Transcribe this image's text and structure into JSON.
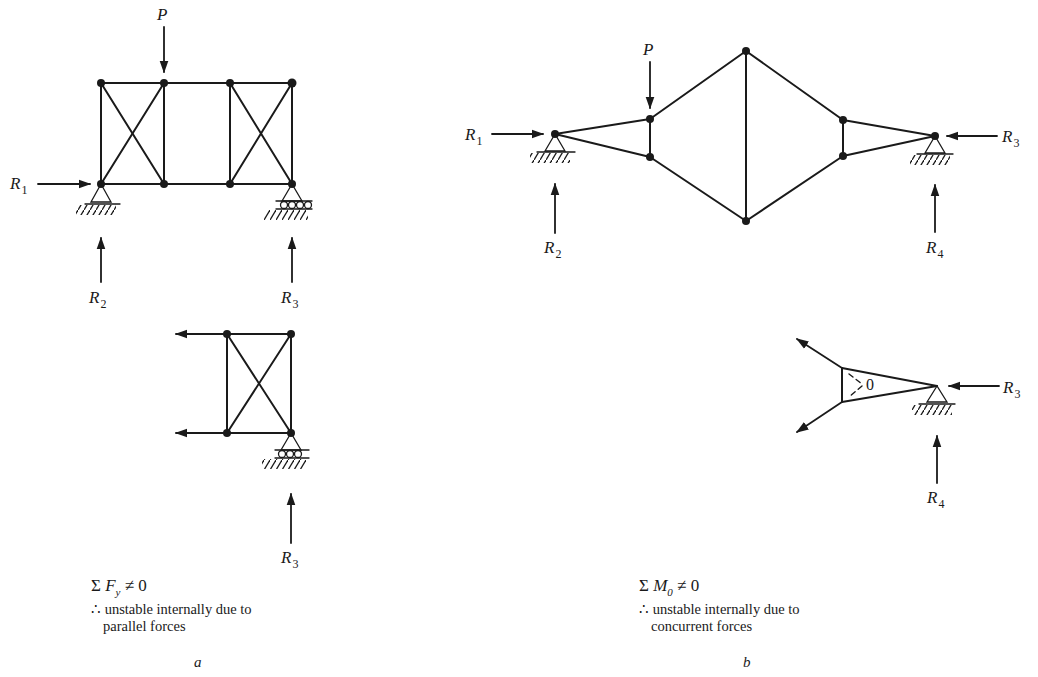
{
  "figure": {
    "panel_a": {
      "letter": "a",
      "load_label": "P",
      "reactions": {
        "R1": {
          "sym": "R",
          "sub": "1"
        },
        "R2": {
          "sym": "R",
          "sub": "2"
        },
        "R3": {
          "sym": "R",
          "sub": "3"
        },
        "R3_free_body": {
          "sym": "R",
          "sub": "3"
        }
      },
      "equation": {
        "sigma": "Σ",
        "sym": "F",
        "sub": "y",
        "rel": "≠ 0"
      },
      "caption_line1": "∴ unstable internally due to",
      "caption_line2": "parallel forces"
    },
    "panel_b": {
      "letter": "b",
      "load_label": "P",
      "reactions": {
        "R1": {
          "sym": "R",
          "sub": "1"
        },
        "R2": {
          "sym": "R",
          "sub": "2"
        },
        "R3": {
          "sym": "R",
          "sub": "3"
        },
        "R4": {
          "sym": "R",
          "sub": "4"
        },
        "R3_free_body": {
          "sym": "R",
          "sub": "3"
        },
        "R4_free_body": {
          "sym": "R",
          "sub": "4"
        }
      },
      "moment_label": "0",
      "equation": {
        "sigma": "Σ",
        "sym": "M",
        "sub": "0",
        "rel": "≠ 0"
      },
      "caption_line1": "∴ unstable internally due to",
      "caption_line2": "concurrent forces"
    }
  },
  "colors": {
    "ink": "#1a1a1a",
    "paper": "#ffffff"
  }
}
